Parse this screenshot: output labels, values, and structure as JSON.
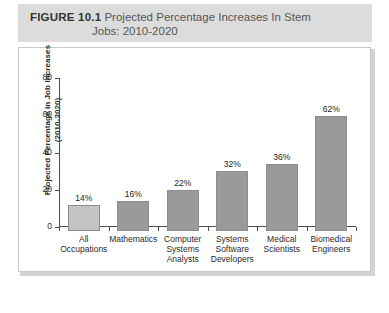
{
  "figure": {
    "label": "FIGURE 10.1",
    "caption_line1": "Projected Percentage Increases In Stem",
    "caption_line2": "Jobs: 2010-2020"
  },
  "colors": {
    "caption_band": "#dcdcdc",
    "panel_border": "#c9c9c9",
    "axis": "#4d4d4d",
    "bar_first": "#c4c4c4",
    "bar_rest": "#9a9a9a",
    "bar_outline": "#8c8c8c"
  },
  "chart_data": {
    "type": "bar",
    "title": "Projected Percentage Increases In Stem Jobs: 2010-2020",
    "xlabel": "",
    "ylabel": "Projected Percentage in Job Increases (2010-2020)",
    "ylabel_line1": "Projected Percentage in Job Increases",
    "ylabel_line2": "(2010-2020)",
    "ylim": [
      0,
      80
    ],
    "yticks": [
      0,
      20,
      40,
      60,
      80
    ],
    "ytick_labels": [
      "0",
      "20",
      "40",
      "60",
      "80"
    ],
    "grid": false,
    "legend": "none",
    "categories": [
      "All Occupations",
      "Mathematics",
      "Computer Systems Analysts",
      "Systems Software Developers",
      "Medical Scientists",
      "Biomedical Engineers"
    ],
    "category_lines": [
      [
        "All",
        "Occupations"
      ],
      [
        "Mathematics"
      ],
      [
        "Computer",
        "Systems",
        "Analysts"
      ],
      [
        "Systems",
        "Software",
        "Developers"
      ],
      [
        "Medical",
        "Scientists"
      ],
      [
        "Biomedical",
        "Engineers"
      ]
    ],
    "values": [
      14,
      16,
      22,
      32,
      36,
      62
    ],
    "data_labels": [
      "14%",
      "16%",
      "22%",
      "32%",
      "36%",
      "62%"
    ]
  }
}
